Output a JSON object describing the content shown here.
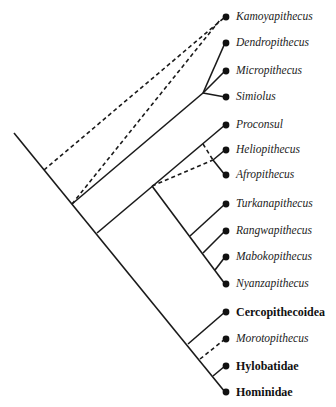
{
  "diagram": {
    "type": "cladogram",
    "taxa": [
      {
        "id": "kamoyapithecus",
        "label": "Kamoyapithecus",
        "style": "italic",
        "y": 17
      },
      {
        "id": "dendropithecus",
        "label": "Dendropithecus",
        "style": "italic",
        "y": 43
      },
      {
        "id": "micropithecus",
        "label": "Micropithecus",
        "style": "italic",
        "y": 71
      },
      {
        "id": "simiolus",
        "label": "Simiolus",
        "style": "italic",
        "y": 97
      },
      {
        "id": "proconsul",
        "label": "Proconsul",
        "style": "italic",
        "y": 125
      },
      {
        "id": "heliopithecus",
        "label": "Heliopithecus",
        "style": "italic",
        "y": 150
      },
      {
        "id": "afropithecus",
        "label": "Afropithecus",
        "style": "italic",
        "y": 175
      },
      {
        "id": "turkanapithecus",
        "label": "Turkanapithecus",
        "style": "italic",
        "y": 204
      },
      {
        "id": "rangwapithecus",
        "label": "Rangwapithecus",
        "style": "italic",
        "y": 231
      },
      {
        "id": "mabokopithecus",
        "label": "Mabokopithecus",
        "style": "italic",
        "y": 257
      },
      {
        "id": "nyanzapithecus",
        "label": "Nyanzapithecus",
        "style": "italic",
        "y": 284
      },
      {
        "id": "cercopithecoidea",
        "label": "Cercopithecoidea",
        "style": "bold",
        "y": 312
      },
      {
        "id": "morotopithecus",
        "label": "Morotopithecus",
        "style": "italic",
        "y": 339
      },
      {
        "id": "hylobatidae",
        "label": "Hylobatidae",
        "style": "bold",
        "y": 366
      },
      {
        "id": "hominidae",
        "label": "Hominidae",
        "style": "bold",
        "y": 392
      }
    ],
    "edges": [
      {
        "from": [
          14,
          133
        ],
        "to": [
          225,
          392
        ],
        "style": "solid",
        "name": "main-spine"
      },
      {
        "from": [
          44,
          170
        ],
        "to": [
          225,
          17
        ],
        "style": "dashed",
        "name": "kamoyapithecus-branch-a"
      },
      {
        "from": [
          72,
          204
        ],
        "to": [
          220,
          20
        ],
        "style": "dashed",
        "name": "kamoyapithecus-branch-b"
      },
      {
        "from": [
          72,
          204
        ],
        "to": [
          203,
          93
        ],
        "style": "solid",
        "name": "dendropithecus-clade-stem"
      },
      {
        "from": [
          203,
          93
        ],
        "to": [
          225,
          43
        ],
        "style": "solid",
        "name": "dendropithecus-branch"
      },
      {
        "from": [
          203,
          93
        ],
        "to": [
          225,
          71
        ],
        "style": "solid",
        "name": "micropithecus-branch"
      },
      {
        "from": [
          203,
          93
        ],
        "to": [
          225,
          97
        ],
        "style": "solid",
        "name": "simiolus-branch"
      },
      {
        "from": [
          97,
          233
        ],
        "to": [
          225,
          125
        ],
        "style": "solid",
        "name": "proconsul-clade-stem"
      },
      {
        "from": [
          203,
          144
        ],
        "to": [
          213,
          160
        ],
        "style": "dashed",
        "name": "heliopithecus-afropithecus-link"
      },
      {
        "from": [
          152,
          186
        ],
        "to": [
          213,
          160
        ],
        "style": "dashed",
        "name": "heliopithecus-afropithecus-stem"
      },
      {
        "from": [
          213,
          160
        ],
        "to": [
          225,
          150
        ],
        "style": "solid",
        "name": "heliopithecus-branch"
      },
      {
        "from": [
          213,
          160
        ],
        "to": [
          225,
          175
        ],
        "style": "solid",
        "name": "afropithecus-branch"
      },
      {
        "from": [
          152,
          186
        ],
        "to": [
          225,
          284
        ],
        "style": "solid",
        "name": "nyanzapithecine-spine"
      },
      {
        "from": [
          190,
          236
        ],
        "to": [
          225,
          204
        ],
        "style": "solid",
        "name": "turkanapithecus-branch"
      },
      {
        "from": [
          203,
          253
        ],
        "to": [
          225,
          231
        ],
        "style": "solid",
        "name": "rangwapithecus-branch"
      },
      {
        "from": [
          215,
          270
        ],
        "to": [
          225,
          257
        ],
        "style": "solid",
        "name": "mabokopithecus-branch"
      },
      {
        "from": [
          188,
          344
        ],
        "to": [
          225,
          312
        ],
        "style": "solid",
        "name": "cercopithecoidea-branch"
      },
      {
        "from": [
          200,
          359
        ],
        "to": [
          225,
          339
        ],
        "style": "dashed",
        "name": "morotopithecus-branch"
      },
      {
        "from": [
          213,
          376
        ],
        "to": [
          225,
          366
        ],
        "style": "solid",
        "name": "hylobatidae-branch"
      }
    ],
    "colors": {
      "line": "#1a1a1a",
      "dot": "#111111",
      "background": "#ffffff"
    }
  }
}
